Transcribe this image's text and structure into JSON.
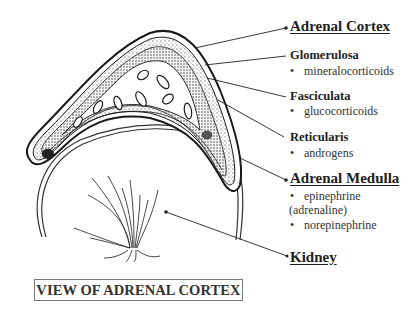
{
  "diagram": {
    "title": "VIEW OF ADRENAL CORTEX",
    "labels": {
      "adrenal_cortex": "Adrenal Cortex",
      "glomerulosa": "Glomerulosa",
      "glomerulosa_item": "mineralocorticoids",
      "fasciculata": "Fasciculata",
      "fasciculata_item": "glucocorticoids",
      "reticularis": "Reticularis",
      "reticularis_item": "androgens",
      "adrenal_medulla": "Adrenal Medulla",
      "medulla_item1": "epinephrine",
      "medulla_item1_cont": "(adrenaline)",
      "medulla_item2": "norepinephrine",
      "kidney": "Kidney"
    },
    "bullet": "•",
    "colors": {
      "line": "#222222",
      "stipple": "#888888",
      "background": "#ffffff"
    }
  }
}
